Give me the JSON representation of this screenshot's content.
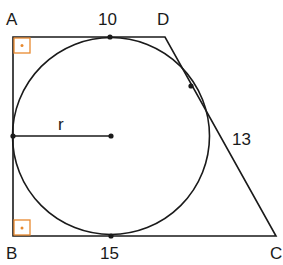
{
  "diagram": {
    "type": "right trapezoid with inscribed circle",
    "vertices": {
      "A": "A",
      "B": "B",
      "C": "C",
      "D": "D"
    },
    "labels": {
      "top_length": "10",
      "bottom_length": "15",
      "slant_length": "13",
      "radius": "r"
    },
    "colors": {
      "stroke": "#1a1a1a",
      "right_angle_marker": "#e8892e"
    }
  }
}
